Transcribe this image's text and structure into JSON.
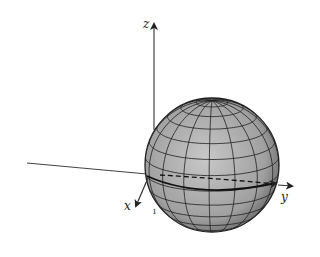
{
  "figure": {
    "axes": {
      "z_label": "z",
      "x_label": "x",
      "y_label": "y"
    },
    "origin_tick": "ı",
    "sphere": {
      "fill_color": "#9a9a9a",
      "highlight_color": "#c8c8c8",
      "grid_color": "#1e1e1e",
      "latitude_lines": 13,
      "longitude_lines": 16
    },
    "equator": {
      "front_style": "solid",
      "back_style": "dashed",
      "has_arrow": true
    },
    "colors": {
      "axis": "#333333",
      "background": "#ffffff"
    }
  }
}
